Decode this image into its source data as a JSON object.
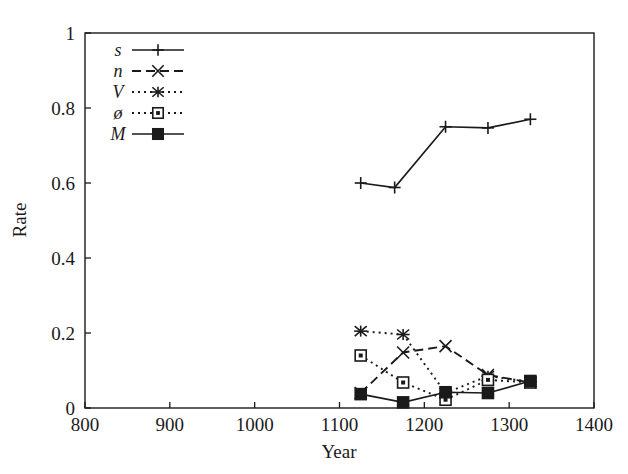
{
  "chart_data": {
    "type": "line",
    "title": "",
    "xlabel": "Year",
    "ylabel": "Rate",
    "xlim": [
      800,
      1400
    ],
    "ylim": [
      0,
      1
    ],
    "xticks": [
      800,
      900,
      1000,
      1100,
      1200,
      1300,
      1400
    ],
    "xtick_labels": [
      "800",
      "900",
      "1000",
      "1100",
      "1200",
      "1300",
      "1400"
    ],
    "yticks": [
      0,
      0.2,
      0.4,
      0.6,
      0.8,
      1
    ],
    "ytick_labels": [
      "0",
      "0.2",
      "0.4",
      "0.6",
      "0.8",
      "1"
    ],
    "grid": false,
    "legend_position": "top-left-inside",
    "series": [
      {
        "name": "s",
        "label": "s",
        "marker": "plus",
        "linestyle": "solid",
        "color": "#1a1a1a",
        "x": [
          1125,
          1165,
          1225,
          1275,
          1325
        ],
        "values": [
          0.6,
          0.588,
          0.75,
          0.747,
          0.77
        ]
      },
      {
        "name": "n",
        "label": "n",
        "marker": "x",
        "linestyle": "dashed",
        "color": "#1a1a1a",
        "x": [
          1125,
          1175,
          1225,
          1275,
          1325
        ],
        "values": [
          0.04,
          0.148,
          0.165,
          0.088,
          0.068
        ]
      },
      {
        "name": "V",
        "label": "V",
        "marker": "star",
        "linestyle": "dotted",
        "color": "#1a1a1a",
        "x": [
          1125,
          1175,
          1225,
          1275,
          1325
        ],
        "values": [
          0.205,
          0.196,
          0.04,
          0.085,
          0.07
        ]
      },
      {
        "name": "oe",
        "label": "ø",
        "marker": "open-square",
        "linestyle": "dotted",
        "color": "#1a1a1a",
        "x": [
          1125,
          1175,
          1225,
          1275,
          1325
        ],
        "values": [
          0.14,
          0.068,
          0.022,
          0.075,
          0.068
        ]
      },
      {
        "name": "M",
        "label": "M",
        "marker": "filled-square",
        "linestyle": "solid",
        "color": "#1a1a1a",
        "x": [
          1125,
          1175,
          1225,
          1275,
          1325
        ],
        "values": [
          0.037,
          0.015,
          0.042,
          0.04,
          0.072
        ]
      }
    ]
  },
  "axes": {
    "x_title": "Year",
    "y_title": "Rate"
  },
  "legend": {
    "items": [
      {
        "label": "s",
        "marker": "plus",
        "linestyle": "solid"
      },
      {
        "label": "n",
        "marker": "x",
        "linestyle": "dashed"
      },
      {
        "label": "V",
        "marker": "star",
        "linestyle": "dotted"
      },
      {
        "label": "ø",
        "marker": "open-square",
        "linestyle": "dotted"
      },
      {
        "label": "M",
        "marker": "filled-square",
        "linestyle": "solid"
      }
    ]
  }
}
